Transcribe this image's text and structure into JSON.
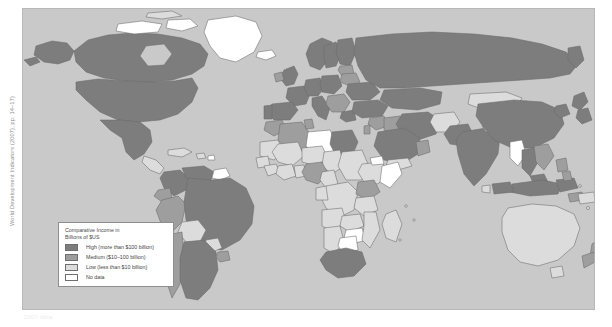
{
  "source_credit": "World Development Indicators (2007), pp. 14–17)",
  "bottom_caption": "2007 data",
  "legend": {
    "title_line1": "Comparative Income in",
    "title_line2": "Billions of $US",
    "items": [
      {
        "label": "High (more than $100 billion)",
        "color": "#7d7d7d",
        "key": "high"
      },
      {
        "label": "Medium ($10–100 billion)",
        "color": "#9e9e9e",
        "key": "medium"
      },
      {
        "label": "Low (less than $10 billion)",
        "color": "#dcdcdc",
        "key": "low"
      },
      {
        "label": "No data",
        "color": "#ffffff",
        "key": "nodata"
      }
    ]
  },
  "map": {
    "type": "choropleth",
    "projection": "world-equirectangular",
    "ocean_color": "#c9c9c9",
    "border_color": "#6b6b6b",
    "classes": {
      "high": {
        "fill": "#7d7d7d",
        "label": "High (more than $100 billion)"
      },
      "medium": {
        "fill": "#9e9e9e",
        "label": "Medium ($10–100 billion)"
      },
      "low": {
        "fill": "#dcdcdc",
        "label": "Low (less than $10 billion)"
      },
      "nodata": {
        "fill": "#ffffff",
        "label": "No data"
      }
    },
    "regions": [
      {
        "name": "Canada",
        "class": "high"
      },
      {
        "name": "United States",
        "class": "high"
      },
      {
        "name": "Alaska",
        "class": "high"
      },
      {
        "name": "Greenland",
        "class": "nodata"
      },
      {
        "name": "Mexico",
        "class": "high"
      },
      {
        "name": "Central America",
        "class": "low"
      },
      {
        "name": "Cuba",
        "class": "low"
      },
      {
        "name": "Caribbean",
        "class": "low"
      },
      {
        "name": "Colombia",
        "class": "high"
      },
      {
        "name": "Venezuela",
        "class": "high"
      },
      {
        "name": "Guyanas",
        "class": "nodata"
      },
      {
        "name": "Brazil",
        "class": "high"
      },
      {
        "name": "Peru",
        "class": "medium"
      },
      {
        "name": "Ecuador",
        "class": "medium"
      },
      {
        "name": "Bolivia",
        "class": "low"
      },
      {
        "name": "Paraguay",
        "class": "low"
      },
      {
        "name": "Chile",
        "class": "medium"
      },
      {
        "name": "Argentina",
        "class": "high"
      },
      {
        "name": "Uruguay",
        "class": "medium"
      },
      {
        "name": "United Kingdom",
        "class": "high"
      },
      {
        "name": "Ireland",
        "class": "medium"
      },
      {
        "name": "Norway",
        "class": "high"
      },
      {
        "name": "Sweden",
        "class": "high"
      },
      {
        "name": "Finland",
        "class": "high"
      },
      {
        "name": "Iceland",
        "class": "nodata"
      },
      {
        "name": "France",
        "class": "high"
      },
      {
        "name": "Spain",
        "class": "high"
      },
      {
        "name": "Portugal",
        "class": "high"
      },
      {
        "name": "Germany",
        "class": "high"
      },
      {
        "name": "Poland",
        "class": "high"
      },
      {
        "name": "Italy",
        "class": "high"
      },
      {
        "name": "Balkans",
        "class": "medium"
      },
      {
        "name": "Greece",
        "class": "high"
      },
      {
        "name": "Ukraine",
        "class": "high"
      },
      {
        "name": "Belarus",
        "class": "medium"
      },
      {
        "name": "Baltics",
        "class": "medium"
      },
      {
        "name": "Russia",
        "class": "high"
      },
      {
        "name": "Kazakhstan",
        "class": "high"
      },
      {
        "name": "Mongolia",
        "class": "low"
      },
      {
        "name": "China",
        "class": "high"
      },
      {
        "name": "Japan",
        "class": "high"
      },
      {
        "name": "Korea",
        "class": "high"
      },
      {
        "name": "India",
        "class": "high"
      },
      {
        "name": "Pakistan",
        "class": "high"
      },
      {
        "name": "Afghanistan",
        "class": "low"
      },
      {
        "name": "Iran",
        "class": "high"
      },
      {
        "name": "Iraq",
        "class": "medium"
      },
      {
        "name": "Saudi Arabia",
        "class": "high"
      },
      {
        "name": "Turkey",
        "class": "high"
      },
      {
        "name": "Syria",
        "class": "medium"
      },
      {
        "name": "Israel",
        "class": "medium"
      },
      {
        "name": "Yemen",
        "class": "low"
      },
      {
        "name": "Oman",
        "class": "medium"
      },
      {
        "name": "Southeast Asia",
        "class": "medium"
      },
      {
        "name": "Thailand",
        "class": "high"
      },
      {
        "name": "Vietnam",
        "class": "medium"
      },
      {
        "name": "Myanmar",
        "class": "nodata"
      },
      {
        "name": "Indonesia",
        "class": "high"
      },
      {
        "name": "Malaysia",
        "class": "high"
      },
      {
        "name": "Philippines",
        "class": "medium"
      },
      {
        "name": "Papua New Guinea",
        "class": "low"
      },
      {
        "name": "Australia",
        "class": "low"
      },
      {
        "name": "New Zealand",
        "class": "medium"
      },
      {
        "name": "Morocco",
        "class": "medium"
      },
      {
        "name": "Algeria",
        "class": "medium"
      },
      {
        "name": "Libya",
        "class": "nodata"
      },
      {
        "name": "Egypt",
        "class": "high"
      },
      {
        "name": "Sudan",
        "class": "low"
      },
      {
        "name": "Mauritania",
        "class": "low"
      },
      {
        "name": "Mali",
        "class": "low"
      },
      {
        "name": "Niger",
        "class": "low"
      },
      {
        "name": "Chad",
        "class": "low"
      },
      {
        "name": "Nigeria",
        "class": "medium"
      },
      {
        "name": "Ghana",
        "class": "low"
      },
      {
        "name": "Ivory Coast",
        "class": "low"
      },
      {
        "name": "Ethiopia",
        "class": "low"
      },
      {
        "name": "Somalia",
        "class": "nodata"
      },
      {
        "name": "Kenya",
        "class": "medium"
      },
      {
        "name": "Tanzania",
        "class": "low"
      },
      {
        "name": "DR Congo",
        "class": "low"
      },
      {
        "name": "Angola",
        "class": "low"
      },
      {
        "name": "Zambia",
        "class": "low"
      },
      {
        "name": "Zimbabwe",
        "class": "nodata"
      },
      {
        "name": "Botswana",
        "class": "nodata"
      },
      {
        "name": "Namibia",
        "class": "low"
      },
      {
        "name": "Mozambique",
        "class": "low"
      },
      {
        "name": "Madagascar",
        "class": "low"
      },
      {
        "name": "South Africa",
        "class": "high"
      }
    ]
  }
}
